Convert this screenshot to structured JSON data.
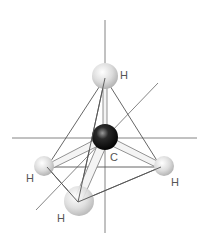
{
  "diagram": {
    "atoms": [
      {
        "id": "H_top",
        "element": "H",
        "label": "H"
      },
      {
        "id": "C",
        "element": "C",
        "label": "C"
      },
      {
        "id": "H_left",
        "element": "H",
        "label": "H"
      },
      {
        "id": "H_right",
        "element": "H",
        "label": "H"
      },
      {
        "id": "H_front",
        "element": "H",
        "label": "H"
      }
    ],
    "colors": {
      "carbon": "#1a1a1a",
      "hydrogen": "#d8d8d8",
      "lines": "#555555"
    }
  }
}
